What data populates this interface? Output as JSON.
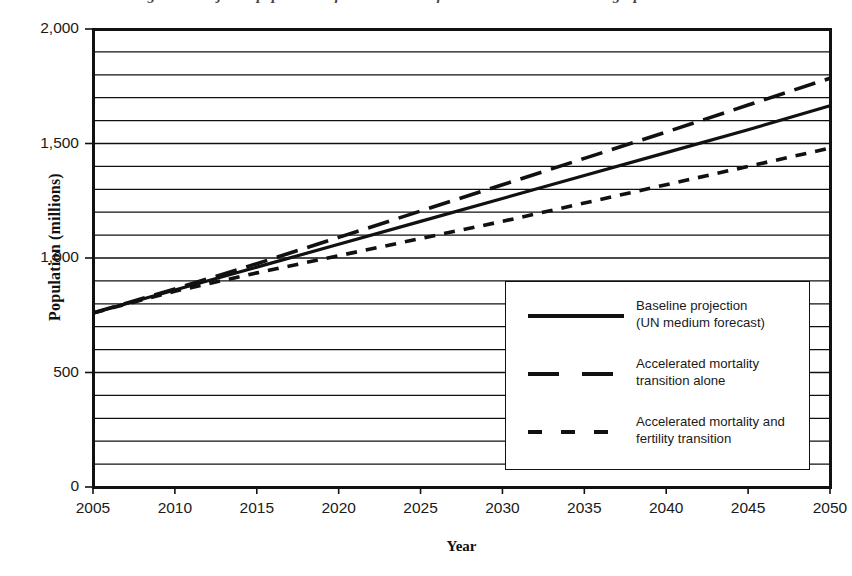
{
  "figure": {
    "title": "Figure 1. Projected population of sub-Saharan Africa under alternative demographic scenarios",
    "background": "#ffffff",
    "ink_color": "#111111"
  },
  "chart_data": {
    "type": "line",
    "title": "",
    "xlabel": "Year",
    "ylabel": "Population (millions)",
    "xlim": [
      2005,
      2050
    ],
    "ylim": [
      0,
      2000
    ],
    "xticks": [
      "2005",
      "2010",
      "2015",
      "2020",
      "2025",
      "2030",
      "2035",
      "2040",
      "2045",
      "2050"
    ],
    "xtick_values": [
      2005,
      2010,
      2015,
      2020,
      2025,
      2030,
      2035,
      2040,
      2045,
      2050
    ],
    "yticks": [
      "0",
      "500",
      "1,000",
      "1,500",
      "2,000"
    ],
    "ytick_values": [
      0,
      500,
      1000,
      1500,
      2000
    ],
    "y_minor_step": 100,
    "grid": "horizontal",
    "grid_minor": true,
    "legend_position": "lower right inside",
    "x": [
      2005,
      2010,
      2015,
      2020,
      2025,
      2030,
      2035,
      2040,
      2045,
      2050
    ],
    "series": [
      {
        "name": "Baseline projection (UN medium forecast)",
        "style": "solid",
        "values": [
          760,
          860,
          960,
          1060,
          1160,
          1260,
          1360,
          1460,
          1560,
          1665
        ]
      },
      {
        "name": "Accelerated mortality transition alone",
        "style": "dashed",
        "values": [
          760,
          865,
          975,
          1090,
          1205,
          1320,
          1435,
          1550,
          1668,
          1785
        ]
      },
      {
        "name": "Accelerated mortality and fertility transition",
        "style": "dotted",
        "values": [
          760,
          855,
          935,
          1010,
          1085,
          1160,
          1240,
          1320,
          1400,
          1480
        ]
      }
    ]
  },
  "legend": {
    "entries": [
      {
        "sample": "solid-line-sample",
        "line1": "Baseline projection",
        "line2": "(UN medium forecast)"
      },
      {
        "sample": "dashed-line-sample",
        "line1": "Accelerated mortality",
        "line2": "transition alone"
      },
      {
        "sample": "dotted-line-sample",
        "line1": "Accelerated mortality and",
        "line2": "fertility transition"
      }
    ]
  }
}
